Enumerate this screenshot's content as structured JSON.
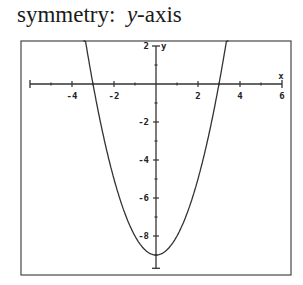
{
  "caption": {
    "prefix": "symmetry:",
    "variable": "y",
    "suffix": "-axis"
  },
  "chart_data": {
    "type": "line",
    "function": "y = x^2 - 9",
    "xlabel": "x",
    "ylabel": "y",
    "xlim": [
      -6,
      6
    ],
    "ylim": [
      -9.7,
      2
    ],
    "x_tick_labels": [
      "-4",
      "-2",
      "2",
      "4",
      "6"
    ],
    "y_tick_labels": [
      "2",
      "-2",
      "-4",
      "-6",
      "-8"
    ],
    "grid": false,
    "series": [
      {
        "name": "parabola",
        "x": [
          -3.4,
          -3,
          -2,
          -1,
          0,
          1,
          2,
          3,
          3.4
        ],
        "y": [
          2.56,
          0,
          -5,
          -8,
          -9,
          -8,
          -5,
          0,
          2.56
        ]
      }
    ],
    "vertex": [
      0,
      -9
    ],
    "x_intercepts": [
      -3,
      3
    ],
    "y_intercept": -9
  },
  "colors": {
    "ink": "#333333",
    "frame": "#555555"
  }
}
